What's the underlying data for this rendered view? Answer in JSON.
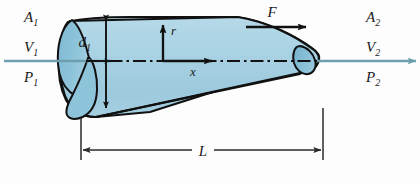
{
  "figure": {
    "background_color": "#fdfdfd"
  },
  "colors": {
    "body_fill_light": "#a9d2e3",
    "body_fill_mid": "#9ccbdf",
    "nose_cap_fill": "#8cc3da",
    "tail_cap_fill": "#7fbad4",
    "outline": "#111111",
    "flow_arrow": "#6f9fae",
    "centerline": "#111111",
    "dimension_line": "#2a2a2a",
    "text": "#1a1a1a"
  },
  "inlet": {
    "area_symbol": "A",
    "area_subscript": "1",
    "velocity_symbol": "V",
    "velocity_subscript": "1",
    "pressure_symbol": "P",
    "pressure_subscript": "1"
  },
  "outlet": {
    "area_symbol": "A",
    "area_subscript": "2",
    "velocity_symbol": "V",
    "velocity_subscript": "2",
    "pressure_symbol": "P",
    "pressure_subscript": "2"
  },
  "diameter": {
    "symbol": "d",
    "subscript": "1"
  },
  "axes": {
    "vertical_label": "r",
    "horizontal_label": "x"
  },
  "force": {
    "label": "F"
  },
  "length": {
    "label": "L"
  }
}
